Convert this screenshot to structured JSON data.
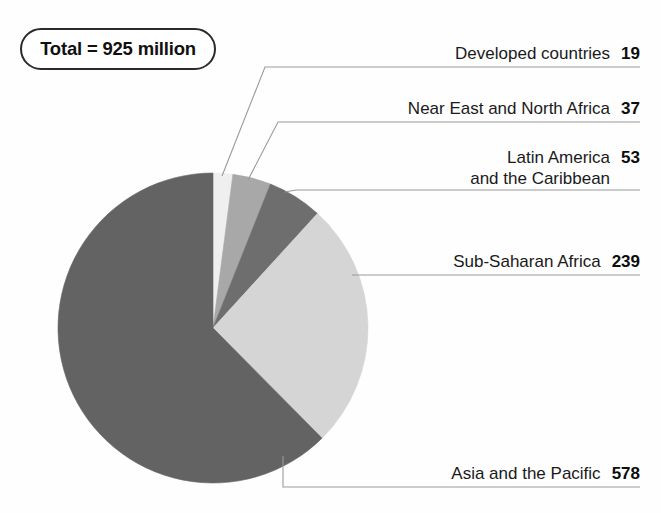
{
  "chart_data": {
    "type": "pie",
    "title": "",
    "total_label": "Total = 925 million",
    "total_value": 925,
    "units": "million",
    "legend_position": "right-callouts",
    "categories": [
      "Developed countries",
      "Near East and North Africa",
      "Latin America and the Caribbean",
      "Sub-Saharan Africa",
      "Asia and the Pacific"
    ],
    "values": [
      19,
      37,
      53,
      239,
      578
    ],
    "colors": [
      "#efefef",
      "#a8a8a8",
      "#6e6e6e",
      "#d5d5d5",
      "#636363"
    ],
    "slices": [
      {
        "label": "Developed countries",
        "label_line1": "Developed countries",
        "label_line2": "",
        "value": 19,
        "value_text": "19",
        "color": "#efefef",
        "percent": 2.1
      },
      {
        "label": "Near East and North Africa",
        "label_line1": "Near East and North Africa",
        "label_line2": "",
        "value": 37,
        "value_text": "37",
        "color": "#a8a8a8",
        "percent": 4.0
      },
      {
        "label": "Latin America and the Caribbean",
        "label_line1": "Latin America",
        "label_line2": "and the Caribbean",
        "value": 53,
        "value_text": "53",
        "color": "#6e6e6e",
        "percent": 5.7
      },
      {
        "label": "Sub-Saharan Africa",
        "label_line1": "Sub-Saharan Africa",
        "label_line2": "",
        "value": 239,
        "value_text": "239",
        "color": "#d5d5d5",
        "percent": 25.8
      },
      {
        "label": "Asia and the Pacific",
        "label_line1": "Asia and the Pacific",
        "label_line2": "",
        "value": 578,
        "value_text": "578",
        "color": "#636363",
        "percent": 62.5
      }
    ]
  },
  "badge": {
    "text": "Total = 925 million"
  },
  "labels": {
    "developed": {
      "text": "Developed countries",
      "value": "19"
    },
    "near_east": {
      "text": "Near East and North Africa",
      "value": "37"
    },
    "latin_america": {
      "line1": "Latin America",
      "line2": "and the Caribbean",
      "value": "53"
    },
    "sub_saharan": {
      "text": "Sub-Saharan Africa",
      "value": "239"
    },
    "asia_pacific": {
      "text": "Asia and the Pacific",
      "value": "578"
    }
  }
}
